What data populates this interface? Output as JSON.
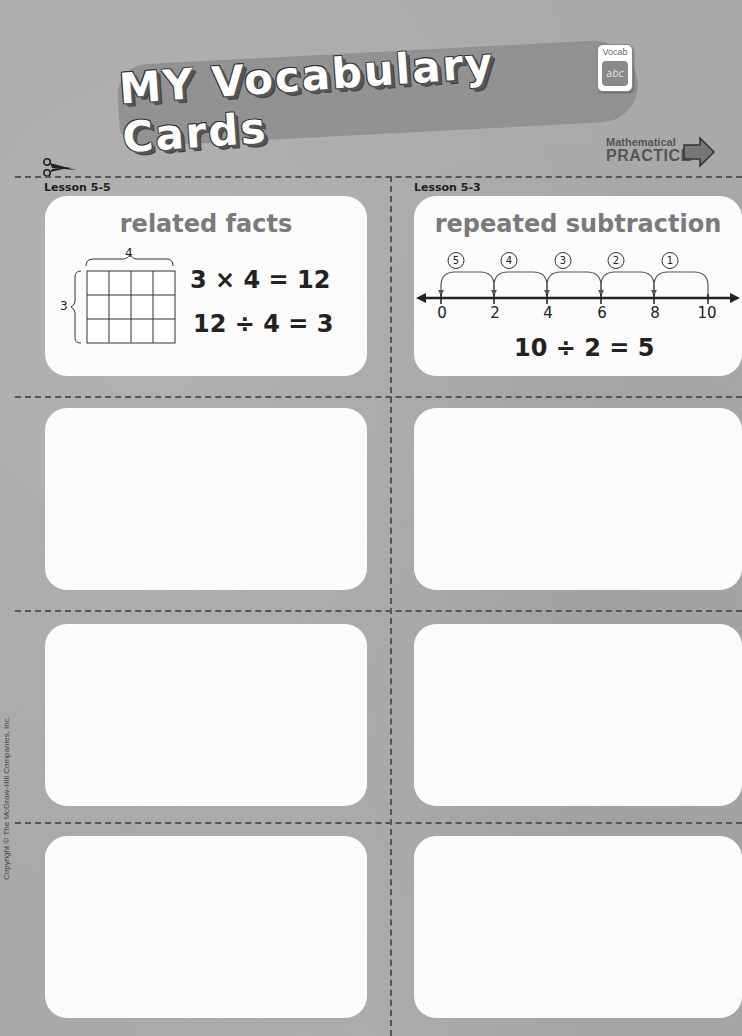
{
  "header": {
    "title": "MY Vocabulary Cards",
    "badge_label": "Vocab",
    "badge_icon_text": "abc",
    "math_practice_line1": "Mathematical",
    "math_practice_line2": "PRACTICE"
  },
  "copyright": "Copyright © The McGraw-Hill Companies, Inc.",
  "cards": [
    {
      "lesson": "Lesson 5-5",
      "term": "related facts",
      "array": {
        "rows": 3,
        "cols": 4,
        "row_label": "3",
        "col_label": "4"
      },
      "equations": [
        "3 × 4 = 12",
        "12 ÷ 4 = 3"
      ]
    },
    {
      "lesson": "Lesson 5-3",
      "term": "repeated subtraction",
      "number_line": {
        "ticks": [
          "0",
          "2",
          "4",
          "6",
          "8",
          "10"
        ],
        "jump_labels": [
          "5",
          "4",
          "3",
          "2",
          "1"
        ]
      },
      "equations": [
        "10 ÷ 2 = 5"
      ]
    },
    {
      "lesson": "",
      "term": ""
    },
    {
      "lesson": "",
      "term": ""
    },
    {
      "lesson": "",
      "term": ""
    },
    {
      "lesson": "",
      "term": ""
    },
    {
      "lesson": "",
      "term": ""
    },
    {
      "lesson": "",
      "term": ""
    }
  ]
}
